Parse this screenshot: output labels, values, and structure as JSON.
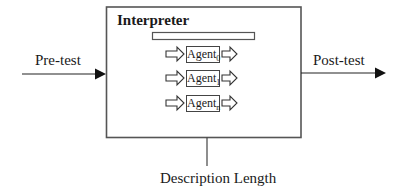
{
  "diagram": {
    "interpreter": {
      "title": "Interpreter"
    },
    "input": {
      "label": "Pre-test"
    },
    "output": {
      "label": "Post-test"
    },
    "parameter": {
      "label": "Description Length"
    },
    "agents": [
      {
        "name": "Agent",
        "subscript": "0"
      },
      {
        "name": "Agent",
        "subscript": "1"
      },
      {
        "name": "Agent",
        "subscript": "n"
      }
    ]
  }
}
